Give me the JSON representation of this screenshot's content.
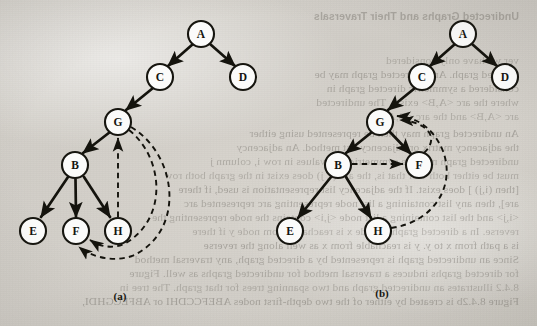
{
  "page": {
    "width": 537,
    "height": 326,
    "background_color": "#d9d6d0",
    "ink_color": "#14130d",
    "node_fill": "#fbfbfa"
  },
  "figures": [
    {
      "id": "a",
      "label": "(a)",
      "label_x": 120,
      "label_y": 297
    },
    {
      "id": "b",
      "label": "(b)",
      "label_y": 294,
      "label_x": 382
    }
  ],
  "graph_a": {
    "caption": "(a)",
    "nodes": [
      {
        "id": "A",
        "label": "A",
        "x": 201,
        "y": 34,
        "r": 13
      },
      {
        "id": "C",
        "label": "C",
        "x": 160,
        "y": 77,
        "r": 13
      },
      {
        "id": "D",
        "label": "D",
        "x": 243,
        "y": 77,
        "r": 13
      },
      {
        "id": "G",
        "label": "G",
        "x": 118,
        "y": 122,
        "r": 13
      },
      {
        "id": "B",
        "label": "B",
        "x": 75,
        "y": 165,
        "r": 13
      },
      {
        "id": "E",
        "label": "E",
        "x": 33,
        "y": 231,
        "r": 13
      },
      {
        "id": "F",
        "label": "F",
        "x": 76,
        "y": 231,
        "r": 13
      },
      {
        "id": "H",
        "label": "H",
        "x": 118,
        "y": 231,
        "r": 13
      }
    ],
    "tree_edges": [
      {
        "from": "A",
        "to": "C",
        "style": "solid",
        "arrow": true
      },
      {
        "from": "A",
        "to": "D",
        "style": "solid",
        "arrow": true
      },
      {
        "from": "C",
        "to": "G",
        "style": "solid",
        "arrow": true
      },
      {
        "from": "G",
        "to": "B",
        "style": "solid",
        "arrow": true
      },
      {
        "from": "B",
        "to": "E",
        "style": "solid",
        "arrow": true
      },
      {
        "from": "B",
        "to": "F",
        "style": "solid",
        "arrow": true
      },
      {
        "from": "B",
        "to": "H",
        "style": "solid",
        "arrow": true
      }
    ],
    "back_edges": [
      {
        "from": "H",
        "to": "G",
        "style": "dashed",
        "arrow": true,
        "shape": "straight-up"
      },
      {
        "from": "G",
        "to": "F",
        "style": "dashed",
        "arrow": true,
        "shape": "wide-right-curve"
      },
      {
        "from": "G",
        "to": "F",
        "style": "dashed",
        "arrow": true,
        "shape": "outer-right-curve"
      }
    ]
  },
  "graph_b": {
    "caption": "(b)",
    "nodes": [
      {
        "id": "A",
        "label": "A",
        "x": 463,
        "y": 34,
        "r": 13
      },
      {
        "id": "C",
        "label": "C",
        "x": 422,
        "y": 77,
        "r": 13
      },
      {
        "id": "D",
        "label": "D",
        "x": 505,
        "y": 77,
        "r": 13
      },
      {
        "id": "G",
        "label": "G",
        "x": 380,
        "y": 122,
        "r": 13
      },
      {
        "id": "B",
        "label": "B",
        "x": 338,
        "y": 165,
        "r": 13
      },
      {
        "id": "F",
        "label": "F",
        "x": 419,
        "y": 165,
        "r": 13
      },
      {
        "id": "E",
        "label": "E",
        "x": 290,
        "y": 231,
        "r": 13
      },
      {
        "id": "H",
        "label": "H",
        "x": 378,
        "y": 231,
        "r": 13
      }
    ],
    "tree_edges": [
      {
        "from": "A",
        "to": "C",
        "style": "solid",
        "arrow": true
      },
      {
        "from": "A",
        "to": "D",
        "style": "solid",
        "arrow": true
      },
      {
        "from": "C",
        "to": "G",
        "style": "solid",
        "arrow": true
      },
      {
        "from": "G",
        "to": "B",
        "style": "solid",
        "arrow": true
      },
      {
        "from": "G",
        "to": "F",
        "style": "solid",
        "arrow": true
      },
      {
        "from": "B",
        "to": "E",
        "style": "solid",
        "arrow": true
      },
      {
        "from": "B",
        "to": "H",
        "style": "solid",
        "arrow": true
      }
    ],
    "back_edges": [
      {
        "from": "B",
        "to": "F",
        "style": "dashed",
        "arrow": true,
        "shape": "horizontal"
      },
      {
        "from": "F",
        "to": "G",
        "style": "dashed",
        "arrow": true,
        "shape": "inner-curve"
      },
      {
        "from": "H",
        "to": "G",
        "style": "dashed",
        "arrow": true,
        "shape": "outer-curve"
      }
    ]
  },
  "bleed_text": {
    "description": "Mirrored show-through text from the reverse side of the scanned page",
    "header": "Undirected Graphs and Their Traversals",
    "lines": [
      {
        "text": "ver we have only considered",
        "x": 18,
        "y": 54
      },
      {
        "text": "directed graph. An undirected graph may be",
        "x": 18,
        "y": 68
      },
      {
        "text": "considered a symmetric directed graph in",
        "x": 18,
        "y": 82
      },
      {
        "text": "where the arc <A,B> exists. The undirected",
        "x": 18,
        "y": 96
      },
      {
        "text": "arc <A,B> and the arc <B,A>.",
        "x": 18,
        "y": 110
      },
      {
        "text": "An undirected graph may then be represented using either",
        "x": 18,
        "y": 127
      },
      {
        "text": "the adjacency matrix or adjacency list method. An adjacency",
        "x": 18,
        "y": 141
      },
      {
        "text": "undirected graph must be symmetric; the values in row i, column j",
        "x": 18,
        "y": 155
      },
      {
        "text": "must be either both 1 or that is, the arc (i, j) does exist in the graph both row",
        "x": 18,
        "y": 169
      },
      {
        "text": "[then (i,j) ] does exist. If the adjacency list representation is used, if there",
        "x": 18,
        "y": 183
      },
      {
        "text": "are], then any list containing a list node representing arc represented arc",
        "x": 18,
        "y": 197
      },
      {
        "text": "<i,j> and the list containing a list node <j,i> contains the node representing the",
        "x": 18,
        "y": 211
      },
      {
        "text": "reverse. In a directed graph, a node x is reachable from node y if there",
        "x": 18,
        "y": 225
      },
      {
        "text": "is a path from x to y. y is reachable from x as well along the reverse",
        "x": 18,
        "y": 239
      },
      {
        "text": "Since an undirected graph is represented by a directed graph, any traversal method",
        "x": 18,
        "y": 253
      },
      {
        "text": "for directed graphs induces a traversal method for undirected graphs as well. Figure",
        "x": 18,
        "y": 267
      },
      {
        "text": "8.4.2 illustrates an undirected graph and two spanning trees for that graph. The tree in",
        "x": 18,
        "y": 281
      },
      {
        "text": "Figure 8.4.2b is created by either of the two depth-first nodes ABEFCCDHI or ABFECGHDI,",
        "x": 18,
        "y": 295
      }
    ]
  }
}
